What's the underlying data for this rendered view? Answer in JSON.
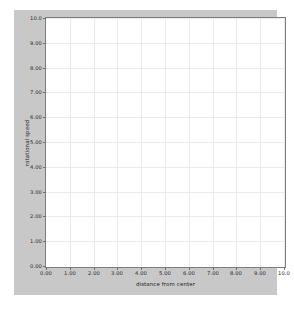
{
  "chart_data": {
    "type": "line",
    "title": "",
    "subtitle": "",
    "xlabel": "distance from center",
    "ylabel": "rotational speed",
    "xlim": [
      0,
      10
    ],
    "ylim": [
      0,
      10
    ],
    "grid": true,
    "legend": null,
    "series": [],
    "x_ticks": [
      0,
      1,
      2,
      3,
      4,
      5,
      6,
      7,
      8,
      9,
      10
    ],
    "y_ticks": [
      0,
      1,
      2,
      3,
      4,
      5,
      6,
      7,
      8,
      9,
      10
    ],
    "x_tick_labels": [
      "0.00",
      "1.00",
      "2.00",
      "3.00",
      "4.00",
      "5.00",
      "6.00",
      "7.00",
      "8.00",
      "9.00",
      "10.0"
    ],
    "y_tick_labels": [
      "0.00",
      "1.00",
      "2.00",
      "3.00",
      "4.00",
      "5.00",
      "6.00",
      "7.00",
      "8.00",
      "9.00",
      "10.0"
    ],
    "data_points": [],
    "annotations": [],
    "colors": {
      "figure_background": "#c8c8c8",
      "plot_background": "#ffffff",
      "gridline": "#e9e9e9",
      "axis_border": "#7d7d7d",
      "tick": "#6f6f6f",
      "label_text": "#1e1e1e",
      "page_background": "#ffffff"
    }
  }
}
